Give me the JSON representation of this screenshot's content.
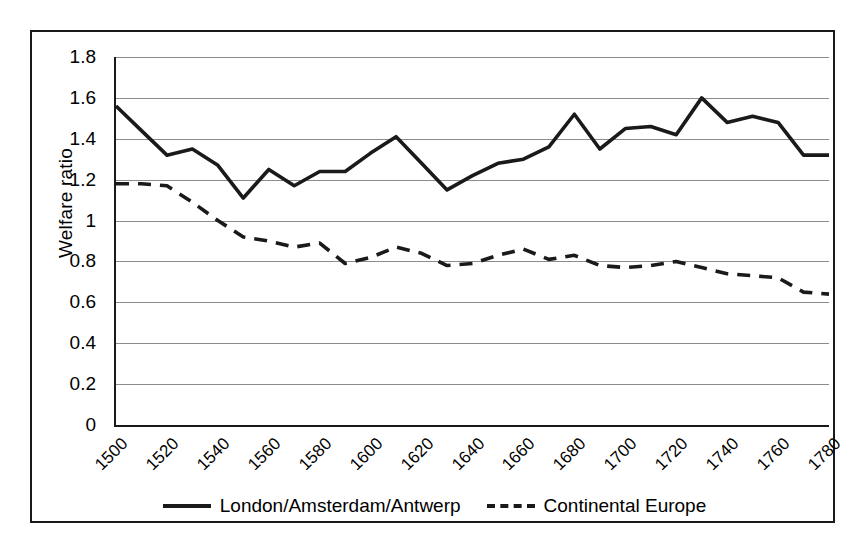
{
  "chart_data": {
    "type": "line",
    "title": "",
    "xlabel": "",
    "ylabel": "Welfare ratio",
    "ylim": [
      0,
      1.8
    ],
    "xlim": [
      1500,
      1780
    ],
    "y_ticks": [
      "1.8",
      "1.6",
      "1.4",
      "1.2",
      "1",
      "0.8",
      "0.6",
      "0.4",
      "0.2",
      "0"
    ],
    "y_tick_values": [
      1.8,
      1.6,
      1.4,
      1.2,
      1.0,
      0.8,
      0.6,
      0.4,
      0.2,
      0
    ],
    "x_ticks": [
      "1500",
      "1520",
      "1540",
      "1560",
      "1580",
      "1600",
      "1620",
      "1640",
      "1660",
      "1680",
      "1700",
      "1720",
      "1740",
      "1760",
      "1780"
    ],
    "x_tick_values": [
      1500,
      1520,
      1540,
      1560,
      1580,
      1600,
      1620,
      1640,
      1660,
      1680,
      1700,
      1720,
      1740,
      1760,
      1780
    ],
    "grid": true,
    "legend_position": "bottom",
    "x": [
      1500,
      1510,
      1520,
      1530,
      1540,
      1550,
      1560,
      1570,
      1580,
      1590,
      1600,
      1610,
      1620,
      1630,
      1640,
      1650,
      1660,
      1670,
      1680,
      1690,
      1700,
      1710,
      1720,
      1730,
      1740,
      1750,
      1760,
      1770,
      1780
    ],
    "series": [
      {
        "name": "London/Amsterdam/Antwerp",
        "style": "solid",
        "color": "#1a1a1a",
        "values": [
          1.56,
          1.44,
          1.32,
          1.35,
          1.27,
          1.11,
          1.25,
          1.17,
          1.24,
          1.24,
          1.33,
          1.41,
          1.28,
          1.15,
          1.22,
          1.28,
          1.3,
          1.36,
          1.52,
          1.35,
          1.45,
          1.46,
          1.42,
          1.6,
          1.48,
          1.51,
          1.48,
          1.32,
          1.32
        ]
      },
      {
        "name": "Continental Europe",
        "style": "dashed",
        "color": "#1a1a1a",
        "values": [
          1.18,
          1.18,
          1.17,
          1.09,
          1.0,
          0.92,
          0.9,
          0.87,
          0.89,
          0.79,
          0.82,
          0.87,
          0.84,
          0.78,
          0.79,
          0.83,
          0.86,
          0.81,
          0.83,
          0.78,
          0.77,
          0.78,
          0.8,
          0.77,
          0.74,
          0.73,
          0.72,
          0.65,
          0.64
        ]
      }
    ]
  },
  "legend": {
    "items": [
      {
        "label": "London/Amsterdam/Antwerp",
        "style": "solid"
      },
      {
        "label": "Continental Europe",
        "style": "dashed"
      }
    ]
  },
  "axis": {
    "y_title": "Welfare ratio"
  }
}
